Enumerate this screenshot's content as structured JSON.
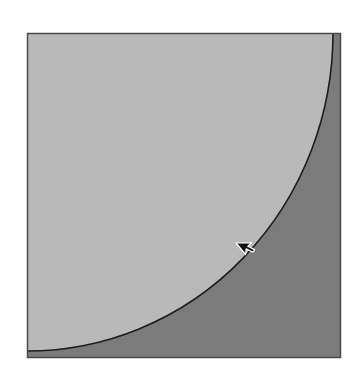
{
  "figure": {
    "description": "Square divided by a quarter-ellipse arc into a light upper-left region and a darker lower-right region, with a mouse cursor near the arc",
    "square": {
      "x": 27,
      "y": 33,
      "width": 314,
      "height": 325
    },
    "regions": [
      {
        "name": "inside-arc",
        "color": "#b9b9b9"
      },
      {
        "name": "outside-arc",
        "color": "#7b7b7b"
      }
    ],
    "arc": {
      "start": [
        333,
        33
      ],
      "end": [
        27,
        351
      ],
      "center": [
        27,
        33
      ],
      "rx": 306,
      "ry": 318,
      "stroke": "#1e1e1e"
    },
    "border_color": "#4a4a4a",
    "cursor": {
      "x": 237,
      "y": 244,
      "icon": "arrow-cursor-icon"
    }
  }
}
